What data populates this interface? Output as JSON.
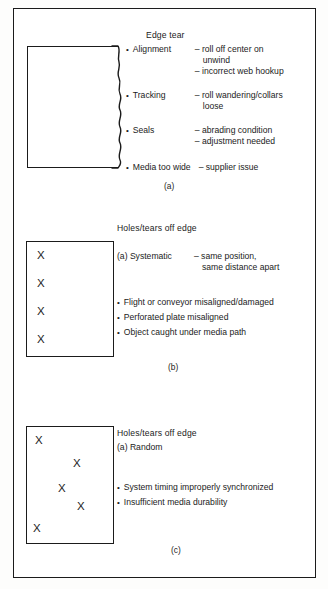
{
  "figure": {
    "panels": [
      {
        "id": "a",
        "caption": "(a)",
        "heading": "Edge tear",
        "defect_illustration": "sheet-with-torn-right-edge",
        "entries": [
          {
            "bullet": "•",
            "term": "Alignment",
            "details": [
              "– roll off center on",
              "unwind",
              "– incorrect web hookup"
            ]
          },
          {
            "bullet": "•",
            "term": "Tracking",
            "details": [
              "– roll wandering/collars",
              "loose"
            ]
          },
          {
            "bullet": "•",
            "term": "Seals",
            "details": [
              "– abrading condition",
              "– adjustment needed"
            ]
          },
          {
            "bullet": "•",
            "term": "Media too wide",
            "details": [
              "– supplier issue"
            ]
          }
        ]
      },
      {
        "id": "b",
        "caption": "(b)",
        "heading": "Holes/tears off edge",
        "defect_illustration": "sheet-with-systematic-x-marks",
        "subhead": {
          "label": "(a) Systematic",
          "details": [
            "– same position,",
            "same distance apart"
          ]
        },
        "marks": [
          "X",
          "X",
          "X",
          "X"
        ],
        "bullets": [
          "Flight or conveyor misaligned/damaged",
          "Perforated plate misaligned",
          "Object caught under media path"
        ]
      },
      {
        "id": "c",
        "caption": "(c)",
        "heading": "Holes/tears off edge",
        "defect_illustration": "sheet-with-random-x-marks",
        "subhead": {
          "label": "(a) Random",
          "details": []
        },
        "marks": [
          "X",
          "X",
          "X",
          "X",
          "X"
        ],
        "bullets": [
          "System timing improperly synchronized",
          "Insufficient media durability"
        ]
      }
    ],
    "bullet_glyph": "•",
    "colors": {
      "ink": "#1b1b1b",
      "page": "#ffffff"
    }
  }
}
